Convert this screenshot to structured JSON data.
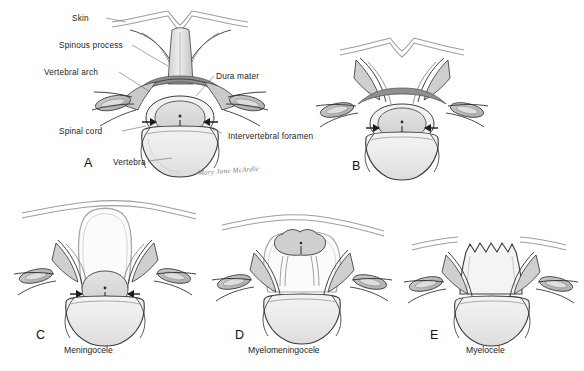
{
  "figure": {
    "background_color": "#ffffff",
    "width": 584,
    "height": 371,
    "signature": "Mary Jane McArdle"
  },
  "colors": {
    "outline": "#2b2b2b",
    "outline_light": "#8d8d8d",
    "bone_fill": "#ededed",
    "bone_fill_dark": "#d8d8d8",
    "tissue_gray": "#b9b9b9",
    "tissue_gray_dark": "#9a9a9a",
    "cord_fill": "#dcdcdc",
    "skin_line": "#9e9e9e",
    "label_text": "#1c1c1c"
  },
  "labels": {
    "skin": "Skin",
    "spinous_process": "Spinous process",
    "vertebral_arch": "Vertebral arch",
    "dura_mater": "Dura mater",
    "spinal_cord": "Spinal cord",
    "intervertebral_foramen": "Intervertebral foramen",
    "vertebra": "Vertebra"
  },
  "panels": [
    {
      "id": "A",
      "letter": "A",
      "caption": "",
      "description": "Normal vertebra in cross section with intact vertebral arch, spinous process, dura mater and spinal cord"
    },
    {
      "id": "B",
      "letter": "B",
      "caption": "",
      "description": "Spina bifida occulta - defect in vertebral arch with intact overlying skin and no protrusion"
    },
    {
      "id": "C",
      "letter": "C",
      "caption": "Meningocele",
      "description": "Meninges protrude through the vertebral arch defect forming a fluid filled sac; spinal cord remains in the vertebral canal"
    },
    {
      "id": "D",
      "letter": "D",
      "caption": "Myelomeningocele",
      "description": "Meninges and neural tissue protrude through the defect into the sac"
    },
    {
      "id": "E",
      "letter": "E",
      "caption": "Myelocele",
      "description": "Open neural tube with exposed neural placode flush at the surface, no covering sac"
    }
  ]
}
